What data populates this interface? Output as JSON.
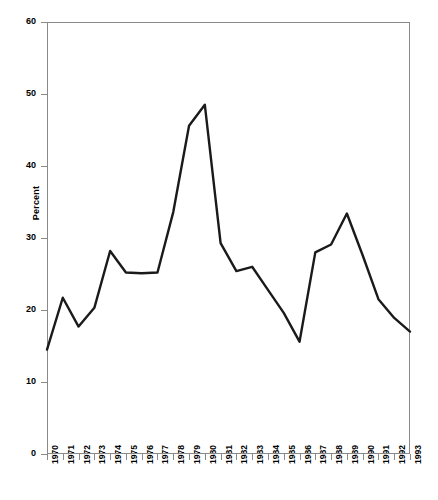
{
  "chart_data": {
    "type": "line",
    "title": "",
    "xlabel": "",
    "ylabel": "Percent",
    "categories": [
      "1970",
      "1971",
      "1972",
      "1973",
      "1974",
      "1975",
      "1976",
      "1977",
      "1978",
      "1979",
      "1980",
      "1981",
      "1982",
      "1983",
      "1984",
      "1985",
      "1986",
      "1987",
      "1988",
      "1989",
      "1990",
      "1991",
      "1992",
      "1993"
    ],
    "values": [
      14.5,
      21.7,
      17.7,
      20.3,
      28.2,
      25.2,
      25.1,
      25.2,
      33.6,
      45.6,
      48.5,
      29.3,
      25.4,
      26.0,
      22.8,
      19.6,
      15.6,
      28.0,
      29.1,
      33.4,
      27.6,
      21.5,
      18.9,
      17.0
    ],
    "series": [
      {
        "name": "Percent",
        "values": [
          14.5,
          21.7,
          17.7,
          20.3,
          28.2,
          25.2,
          25.1,
          25.2,
          33.6,
          45.6,
          48.5,
          29.3,
          25.4,
          26.0,
          22.8,
          19.6,
          15.6,
          28.0,
          29.1,
          33.4,
          27.6,
          21.5,
          18.9,
          17.0
        ]
      }
    ],
    "ylim": [
      0,
      60
    ],
    "y_ticks": [
      0,
      10,
      20,
      30,
      40,
      50,
      60
    ],
    "y_tick_labels": [
      "0",
      "10",
      "20",
      "30",
      "40",
      "50",
      "60"
    ],
    "grid": false,
    "legend": false,
    "line_color": "#1a1a1a",
    "frame_color": "#8a8a8a",
    "background_color": "#ffffff"
  }
}
